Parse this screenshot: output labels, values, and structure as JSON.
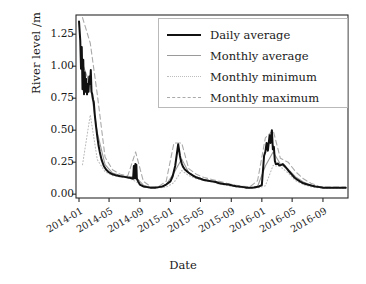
{
  "chart_data": {
    "type": "line",
    "title": "",
    "xlabel": "Date",
    "ylabel": "River level /m",
    "xtick_labels": [
      "2014-01",
      "2014-05",
      "2014-09",
      "2015-01",
      "2015-05",
      "2015-09",
      "2016-01",
      "2016-05",
      "2016-09"
    ],
    "ytick_labels": [
      "0.00",
      "0.25",
      "0.50",
      "0.75",
      "1.00",
      "1.25"
    ],
    "ytick_values": [
      0.0,
      0.25,
      0.5,
      0.75,
      1.0,
      1.25
    ],
    "ylim": [
      -0.03,
      1.4
    ],
    "xlim": [
      "2013-12-20",
      "2016-12-10"
    ],
    "grid": false,
    "legend_position": "upper right",
    "colors": {
      "daily_average": "#111111",
      "monthly_average": "#9a9a9a",
      "monthly_minimum": "#bdbdbd",
      "monthly_maximum": "#aaaaaa",
      "frame": "#2b2b2b",
      "background": "#ffffff"
    },
    "series": [
      {
        "name": "Daily average",
        "style": "solid",
        "width": 2.0,
        "color": "#111111",
        "x": [
          "2014-01-01",
          "2014-01-06",
          "2014-01-09",
          "2014-01-12",
          "2014-01-15",
          "2014-01-18",
          "2014-01-21",
          "2014-01-24",
          "2014-01-27",
          "2014-01-30",
          "2014-02-02",
          "2014-02-05",
          "2014-02-08",
          "2014-02-11",
          "2014-02-14",
          "2014-02-17",
          "2014-02-20",
          "2014-02-23",
          "2014-02-26",
          "2014-03-01",
          "2014-03-05",
          "2014-03-10",
          "2014-03-15",
          "2014-03-20",
          "2014-03-25",
          "2014-04-01",
          "2014-04-10",
          "2014-04-20",
          "2014-05-01",
          "2014-05-15",
          "2014-06-01",
          "2014-06-15",
          "2014-07-01",
          "2014-07-15",
          "2014-08-01",
          "2014-08-05",
          "2014-08-08",
          "2014-08-10",
          "2014-08-12",
          "2014-08-14",
          "2014-08-16",
          "2014-08-18",
          "2014-08-20",
          "2014-08-25",
          "2014-09-01",
          "2014-09-15",
          "2014-10-01",
          "2014-10-15",
          "2014-11-01",
          "2014-11-15",
          "2014-12-01",
          "2014-12-15",
          "2015-01-01",
          "2015-01-10",
          "2015-01-20",
          "2015-02-01",
          "2015-02-08",
          "2015-02-12",
          "2015-02-16",
          "2015-02-20",
          "2015-02-25",
          "2015-03-01",
          "2015-03-10",
          "2015-03-20",
          "2015-04-01",
          "2015-04-15",
          "2015-05-01",
          "2015-05-15",
          "2015-06-01",
          "2015-06-15",
          "2015-07-01",
          "2015-07-15",
          "2015-08-01",
          "2015-08-20",
          "2015-09-01",
          "2015-09-20",
          "2015-10-01",
          "2015-10-20",
          "2015-11-01",
          "2015-11-20",
          "2015-12-01",
          "2015-12-20",
          "2016-01-01",
          "2016-01-10",
          "2016-01-15",
          "2016-01-20",
          "2016-01-25",
          "2016-02-01",
          "2016-02-05",
          "2016-02-10",
          "2016-02-14",
          "2016-02-18",
          "2016-02-22",
          "2016-02-26",
          "2016-03-01",
          "2016-03-06",
          "2016-03-10",
          "2016-03-15",
          "2016-03-20",
          "2016-03-25",
          "2016-04-01",
          "2016-04-10",
          "2016-04-20",
          "2016-05-01",
          "2016-05-10",
          "2016-05-20",
          "2016-06-01",
          "2016-06-15",
          "2016-07-01",
          "2016-07-20",
          "2016-08-01",
          "2016-08-20",
          "2016-09-01",
          "2016-09-20",
          "2016-10-01",
          "2016-10-20",
          "2016-11-01",
          "2016-11-20",
          "2016-12-01"
        ],
        "y": [
          1.35,
          1.2,
          0.98,
          1.15,
          0.82,
          1.05,
          0.78,
          0.95,
          0.8,
          0.9,
          0.78,
          0.86,
          0.8,
          0.92,
          0.86,
          0.97,
          0.8,
          0.78,
          0.74,
          0.72,
          0.62,
          0.53,
          0.45,
          0.38,
          0.33,
          0.27,
          0.22,
          0.19,
          0.17,
          0.155,
          0.145,
          0.14,
          0.135,
          0.13,
          0.125,
          0.12,
          0.22,
          0.125,
          0.125,
          0.235,
          0.125,
          0.23,
          0.12,
          0.1,
          0.075,
          0.06,
          0.055,
          0.05,
          0.05,
          0.055,
          0.06,
          0.075,
          0.1,
          0.14,
          0.22,
          0.39,
          0.3,
          0.26,
          0.235,
          0.215,
          0.2,
          0.19,
          0.175,
          0.16,
          0.145,
          0.13,
          0.12,
          0.11,
          0.105,
          0.1,
          0.095,
          0.085,
          0.08,
          0.075,
          0.07,
          0.062,
          0.06,
          0.055,
          0.05,
          0.05,
          0.052,
          0.06,
          0.07,
          0.3,
          0.33,
          0.4,
          0.34,
          0.46,
          0.4,
          0.5,
          0.35,
          0.37,
          0.26,
          0.235,
          0.235,
          0.24,
          0.225,
          0.225,
          0.23,
          0.235,
          0.22,
          0.2,
          0.175,
          0.15,
          0.13,
          0.115,
          0.1,
          0.085,
          0.075,
          0.065,
          0.06,
          0.055,
          0.05,
          0.05,
          0.05,
          0.05,
          0.05,
          0.05,
          0.05
        ]
      },
      {
        "name": "Monthly average",
        "style": "solid",
        "width": 1.1,
        "color": "#9a9a9a",
        "x": [
          "2014-01-15",
          "2014-02-15",
          "2014-03-15",
          "2014-04-15",
          "2014-05-15",
          "2014-06-15",
          "2014-07-15",
          "2014-08-15",
          "2014-09-15",
          "2014-10-15",
          "2014-11-15",
          "2014-12-15",
          "2015-01-15",
          "2015-02-15",
          "2015-03-15",
          "2015-04-15",
          "2015-05-15",
          "2015-06-15",
          "2015-07-15",
          "2015-08-15",
          "2015-09-15",
          "2015-10-15",
          "2015-11-15",
          "2015-12-15",
          "2016-01-15",
          "2016-02-15",
          "2016-03-15",
          "2016-04-15",
          "2016-05-15",
          "2016-06-15",
          "2016-07-15",
          "2016-08-15",
          "2016-09-15",
          "2016-10-15",
          "2016-11-15",
          "2016-12-01"
        ],
        "y": [
          1.02,
          0.85,
          0.48,
          0.23,
          0.165,
          0.145,
          0.135,
          0.135,
          0.07,
          0.052,
          0.052,
          0.075,
          0.165,
          0.275,
          0.17,
          0.135,
          0.115,
          0.105,
          0.09,
          0.075,
          0.065,
          0.055,
          0.05,
          0.06,
          0.22,
          0.33,
          0.235,
          0.195,
          0.135,
          0.095,
          0.07,
          0.055,
          0.05,
          0.05,
          0.05,
          0.05
        ]
      },
      {
        "name": "Monthly minimum",
        "style": "dotted",
        "width": 1.1,
        "color": "#bdbdbd",
        "x": [
          "2014-01-15",
          "2014-02-15",
          "2014-03-15",
          "2014-04-15",
          "2014-05-15",
          "2014-06-15",
          "2014-07-15",
          "2014-08-15",
          "2014-09-15",
          "2014-10-15",
          "2014-11-15",
          "2014-12-15",
          "2015-01-15",
          "2015-02-15",
          "2015-03-15",
          "2015-04-15",
          "2015-05-15",
          "2015-06-15",
          "2015-07-15",
          "2015-08-15",
          "2015-09-15",
          "2015-10-15",
          "2015-11-15",
          "2015-12-15",
          "2016-01-15",
          "2016-02-15",
          "2016-03-15",
          "2016-04-15",
          "2016-05-15",
          "2016-06-15",
          "2016-07-15",
          "2016-08-15",
          "2016-09-15",
          "2016-10-15",
          "2016-11-15",
          "2016-12-01"
        ],
        "y": [
          0.23,
          0.62,
          0.27,
          0.175,
          0.145,
          0.135,
          0.128,
          0.1,
          0.055,
          0.048,
          0.048,
          0.055,
          0.09,
          0.185,
          0.145,
          0.12,
          0.105,
          0.095,
          0.08,
          0.068,
          0.058,
          0.05,
          0.046,
          0.05,
          0.065,
          0.225,
          0.215,
          0.165,
          0.105,
          0.075,
          0.058,
          0.05,
          0.046,
          0.046,
          0.046,
          0.046
        ]
      },
      {
        "name": "Monthly maximum",
        "style": "dashed",
        "width": 1.1,
        "color": "#aaaaaa",
        "x": [
          "2014-01-15",
          "2014-02-15",
          "2014-03-15",
          "2014-04-15",
          "2014-05-15",
          "2014-06-15",
          "2014-07-15",
          "2014-08-15",
          "2014-09-15",
          "2014-10-15",
          "2014-11-15",
          "2014-12-15",
          "2015-01-15",
          "2015-02-15",
          "2015-03-15",
          "2015-04-15",
          "2015-05-15",
          "2015-06-15",
          "2015-07-15",
          "2015-08-15",
          "2015-09-15",
          "2015-10-15",
          "2015-11-15",
          "2015-12-15",
          "2016-01-15",
          "2016-02-15",
          "2016-03-15",
          "2016-04-15",
          "2016-05-15",
          "2016-06-15",
          "2016-07-15",
          "2016-08-15",
          "2016-09-15",
          "2016-10-15",
          "2016-11-15",
          "2016-12-01"
        ],
        "y": [
          1.38,
          1.18,
          0.78,
          0.29,
          0.19,
          0.155,
          0.145,
          0.33,
          0.1,
          0.058,
          0.06,
          0.1,
          0.4,
          0.4,
          0.2,
          0.155,
          0.13,
          0.115,
          0.1,
          0.085,
          0.072,
          0.062,
          0.058,
          0.105,
          0.44,
          0.5,
          0.28,
          0.25,
          0.175,
          0.12,
          0.085,
          0.062,
          0.055,
          0.055,
          0.055,
          0.055
        ]
      }
    ]
  },
  "axes": {
    "ylabel_text": "River level /m",
    "xlabel_text": "Date"
  }
}
